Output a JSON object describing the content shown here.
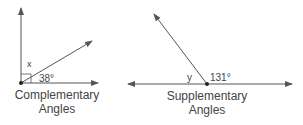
{
  "complementary": {
    "angle_label": "38°",
    "unknown_label": "x",
    "caption_line1": "Complementary",
    "caption_line2": "Angles"
  },
  "supplementary": {
    "angle_label": "131°",
    "unknown_label": "y",
    "caption_line1": "Supplementary",
    "caption_line2": "Angles"
  },
  "colors": {
    "line": "#555555",
    "text": "#444444"
  }
}
